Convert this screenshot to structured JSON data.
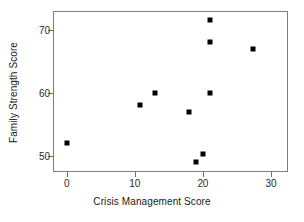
{
  "chart_data": {
    "type": "scatter",
    "title": "",
    "xlabel": "Crisis Management Score",
    "ylabel": "Family Strength Score",
    "xlim": [
      -2,
      32.5
    ],
    "ylim": [
      47.4,
      73
    ],
    "xticks": [
      0,
      10,
      20,
      30
    ],
    "xticklabels": [
      "0",
      "10",
      "20",
      "30"
    ],
    "yticks": [
      50,
      60,
      70
    ],
    "yticklabels": [
      "50",
      "60",
      "70"
    ],
    "grid": false,
    "legend": null,
    "marker": "square",
    "marker_color": "#000000",
    "frame_color": "#7d7d7d",
    "points": [
      {
        "x": 0,
        "y": 52.0
      },
      {
        "x": 10.7,
        "y": 58.0
      },
      {
        "x": 13.0,
        "y": 60.0
      },
      {
        "x": 18.0,
        "y": 57.0
      },
      {
        "x": 19.0,
        "y": 49.0
      },
      {
        "x": 20.0,
        "y": 50.2
      },
      {
        "x": 21.0,
        "y": 60.0
      },
      {
        "x": 21.0,
        "y": 68.0
      },
      {
        "x": 21.0,
        "y": 71.5
      },
      {
        "x": 27.3,
        "y": 67.0
      }
    ]
  }
}
